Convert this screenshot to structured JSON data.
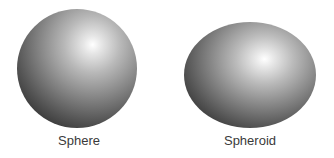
{
  "figure": {
    "items": [
      {
        "label": "Sphere",
        "shape": "sphere"
      },
      {
        "label": "Spheroid",
        "shape": "spheroid"
      }
    ]
  }
}
